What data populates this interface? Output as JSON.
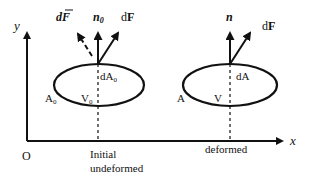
{
  "figure": {
    "axes": {
      "x_label": "x",
      "y_label": "y",
      "origin_label": "O"
    },
    "initial": {
      "caption_line1": "Initial",
      "caption_line2": "undeformed",
      "area_label": "A",
      "area_subscript": "0",
      "volume_label": "V",
      "volume_subscript": "0",
      "element_label": "dA",
      "element_subscript": "0",
      "normal_label": "n",
      "normal_subscript": "0",
      "force_label": "dF",
      "pseudo_force_label": "dF̅"
    },
    "deformed": {
      "caption": "deformed",
      "area_label": "A",
      "volume_label": "V",
      "element_label": "dA",
      "normal_label": "n",
      "force_label": "dF"
    },
    "colors": {
      "stroke": "#111111",
      "background": "#ffffff"
    }
  }
}
